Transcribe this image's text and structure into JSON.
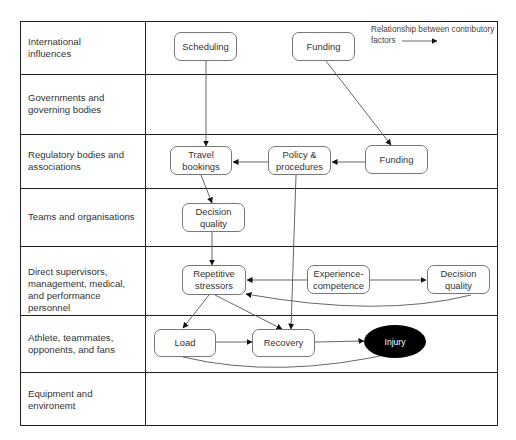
{
  "legend": {
    "line1": "Relationship between contributory",
    "line2": "factors"
  },
  "rows": [
    {
      "label": "International influences"
    },
    {
      "label": "Governments and governing bodies"
    },
    {
      "label": "Regulatory bodies and associations"
    },
    {
      "label": "Teams and organisations"
    },
    {
      "label": "Direct supervisors, management, medical, and performance personnel"
    },
    {
      "label": "Athlete, teammates, opponents, and fans"
    },
    {
      "label": "Equipment and environemt"
    }
  ],
  "nodes": {
    "scheduling": "Scheduling",
    "funding_intl": "Funding",
    "travel_bookings": "Travel bookings",
    "policy_procedures": "Policy & procedures",
    "funding_reg": "Funding",
    "decision_quality_team": "Decision quality",
    "repetitive_stressors": "Repetitive stressors",
    "experience_competence": "Experience-competence",
    "decision_quality_sup": "Decision quality",
    "load": "Load",
    "recovery": "Recovery",
    "injury": "Injury"
  },
  "edges": [
    {
      "from": "Scheduling",
      "to": "Travel bookings"
    },
    {
      "from": "Funding (international)",
      "to": "Funding (regulatory)"
    },
    {
      "from": "Funding (regulatory)",
      "to": "Policy & procedures"
    },
    {
      "from": "Policy & procedures",
      "to": "Travel bookings"
    },
    {
      "from": "Travel bookings",
      "to": "Decision quality (teams)"
    },
    {
      "from": "Policy & procedures",
      "to": "Recovery"
    },
    {
      "from": "Decision quality (teams)",
      "to": "Repetitive stressors"
    },
    {
      "from": "Experience-competence",
      "to": "Repetitive stressors"
    },
    {
      "from": "Experience-competence",
      "to": "Decision quality (supervisors)"
    },
    {
      "from": "Decision quality (supervisors)",
      "to": "Repetitive stressors"
    },
    {
      "from": "Repetitive stressors",
      "to": "Load"
    },
    {
      "from": "Repetitive stressors",
      "to": "Recovery"
    },
    {
      "from": "Load",
      "to": "Recovery"
    },
    {
      "from": "Recovery",
      "to": "Injury"
    },
    {
      "from": "Load",
      "to": "Injury"
    }
  ]
}
